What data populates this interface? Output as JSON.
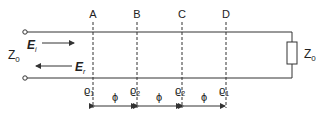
{
  "diagram": {
    "title": "",
    "source_impedance": {
      "label": "Z",
      "sub": "0"
    },
    "load_impedance": {
      "label": "Z",
      "sub": "0"
    },
    "incident_wave": {
      "label": "E",
      "sub": "i"
    },
    "reflected_wave": {
      "label": "E",
      "sub": "r"
    },
    "planes": [
      {
        "name": "A",
        "rho": "ϱ",
        "rho_sub": "1"
      },
      {
        "name": "B",
        "rho": "ϱ",
        "rho_sub": "2"
      },
      {
        "name": "C",
        "rho": "ϱ",
        "rho_sub": "2"
      },
      {
        "name": "D",
        "rho": "ϱ",
        "rho_sub": "1"
      }
    ],
    "spacings": [
      {
        "label": "ϕ"
      },
      {
        "label": "ϕ"
      },
      {
        "label": "ϕ"
      }
    ],
    "colors": {
      "line": "#333333",
      "text": "#222222"
    }
  }
}
